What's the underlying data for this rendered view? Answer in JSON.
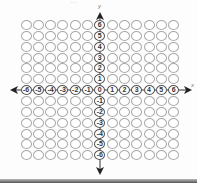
{
  "diagram": {
    "type": "coordinate-grid",
    "columns": 13,
    "rows": 13,
    "x_axis": {
      "label": "x",
      "ticks": [
        "-6",
        "-5",
        "-4",
        "-3",
        "-2",
        "-1",
        "0",
        "1",
        "2",
        "3",
        "4",
        "5",
        "6"
      ]
    },
    "y_axis": {
      "label": "y",
      "ticks": [
        "6",
        "5",
        "4",
        "3",
        "2",
        "1",
        "0",
        "-1",
        "-2",
        "-3",
        "-4",
        "-5",
        "-6"
      ]
    },
    "colors": {
      "circle_stroke": "#a9a9a9",
      "axis": "#333333",
      "background": "#fdfdfd"
    },
    "top_text_fragment": "…"
  }
}
